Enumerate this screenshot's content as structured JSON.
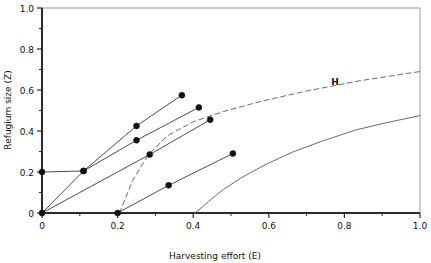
{
  "chart_data": {
    "type": "line",
    "title": "",
    "xlabel": "Harvesting effort (E)",
    "ylabel": "Refugium size (Z)",
    "xlim": [
      0,
      1.0
    ],
    "ylim": [
      0,
      1.0
    ],
    "xticks": [
      "0",
      "0.2",
      "0.4",
      "0.6",
      "0.8",
      "1.0"
    ],
    "xtick_values": [
      0,
      0.2,
      0.4,
      0.6,
      0.8,
      1.0
    ],
    "yticks": [
      "0",
      "0.2",
      "0.4",
      "0.6",
      "0.8",
      "1.0"
    ],
    "ytick_values": [
      0,
      0.2,
      0.4,
      0.6,
      0.8,
      1.0
    ],
    "xminor": [
      0.1,
      0.3,
      0.5,
      0.7,
      0.9
    ],
    "yminor": [
      0.1,
      0.3,
      0.5,
      0.7,
      0.9
    ],
    "grid": false,
    "legend": "none",
    "annotations": [
      {
        "text": "H",
        "x": 0.775,
        "y": 0.625,
        "name": "curve-label-h"
      }
    ],
    "series": [
      {
        "name": "isocline-1",
        "style": "solid",
        "color": "#4d4d4d",
        "marker": "circle",
        "points": [
          {
            "x": 0.0,
            "y": 0.2
          },
          {
            "x": 0.11,
            "y": 0.205
          },
          {
            "x": 0.25,
            "y": 0.425
          },
          {
            "x": 0.37,
            "y": 0.575
          }
        ],
        "marker_points": [
          {
            "x": 0.0,
            "y": 0.2
          },
          {
            "x": 0.11,
            "y": 0.205
          },
          {
            "x": 0.25,
            "y": 0.425
          },
          {
            "x": 0.37,
            "y": 0.575
          }
        ]
      },
      {
        "name": "isocline-2",
        "style": "solid",
        "color": "#4d4d4d",
        "marker": "circle",
        "points": [
          {
            "x": 0.0,
            "y": 0.0
          },
          {
            "x": 0.11,
            "y": 0.205
          },
          {
            "x": 0.25,
            "y": 0.355
          },
          {
            "x": 0.415,
            "y": 0.515
          }
        ],
        "marker_points": [
          {
            "x": 0.11,
            "y": 0.205
          },
          {
            "x": 0.25,
            "y": 0.355
          },
          {
            "x": 0.415,
            "y": 0.515
          }
        ]
      },
      {
        "name": "isocline-3",
        "style": "solid",
        "color": "#4d4d4d",
        "marker": "circle",
        "points": [
          {
            "x": 0.0,
            "y": 0.0
          },
          {
            "x": 0.285,
            "y": 0.285
          },
          {
            "x": 0.445,
            "y": 0.455
          }
        ],
        "marker_points": [
          {
            "x": 0.0,
            "y": 0.0
          },
          {
            "x": 0.285,
            "y": 0.285
          },
          {
            "x": 0.445,
            "y": 0.455
          }
        ]
      },
      {
        "name": "isocline-4",
        "style": "solid",
        "color": "#4d4d4d",
        "marker": "circle",
        "points": [
          {
            "x": 0.2,
            "y": 0.0
          },
          {
            "x": 0.335,
            "y": 0.135
          },
          {
            "x": 0.505,
            "y": 0.29
          }
        ],
        "marker_points": [
          {
            "x": 0.2,
            "y": 0.0
          },
          {
            "x": 0.335,
            "y": 0.135
          },
          {
            "x": 0.505,
            "y": 0.29
          }
        ]
      },
      {
        "name": "harvest-curve-H",
        "style": "dashed",
        "color": "#6b6b6b",
        "marker": "none",
        "points": [
          {
            "x": 0.205,
            "y": 0.0
          },
          {
            "x": 0.24,
            "y": 0.16
          },
          {
            "x": 0.28,
            "y": 0.28
          },
          {
            "x": 0.33,
            "y": 0.375
          },
          {
            "x": 0.4,
            "y": 0.445
          },
          {
            "x": 0.48,
            "y": 0.495
          },
          {
            "x": 0.58,
            "y": 0.545
          },
          {
            "x": 0.7,
            "y": 0.595
          },
          {
            "x": 0.84,
            "y": 0.645
          },
          {
            "x": 1.0,
            "y": 0.69
          }
        ],
        "marker_points": []
      },
      {
        "name": "lower-solid-curve",
        "style": "solid",
        "color": "#6b6b6b",
        "marker": "none",
        "points": [
          {
            "x": 0.405,
            "y": 0.0
          },
          {
            "x": 0.44,
            "y": 0.055
          },
          {
            "x": 0.48,
            "y": 0.115
          },
          {
            "x": 0.53,
            "y": 0.175
          },
          {
            "x": 0.59,
            "y": 0.235
          },
          {
            "x": 0.66,
            "y": 0.295
          },
          {
            "x": 0.74,
            "y": 0.35
          },
          {
            "x": 0.83,
            "y": 0.405
          },
          {
            "x": 0.91,
            "y": 0.44
          },
          {
            "x": 1.0,
            "y": 0.475
          }
        ],
        "marker_points": []
      }
    ]
  }
}
